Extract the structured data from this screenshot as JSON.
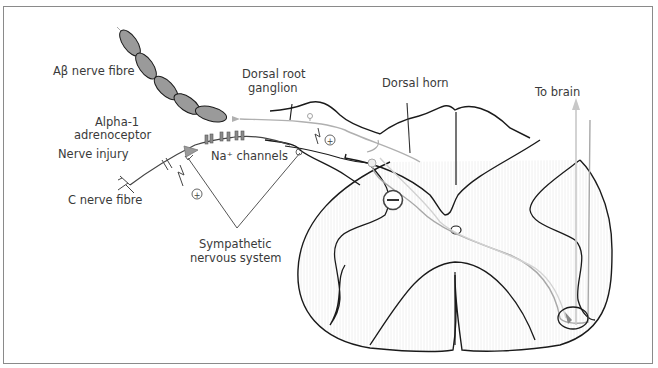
{
  "labels": {
    "ab_fibre": "Aβ nerve fibre",
    "drg_1": "Dorsal root",
    "drg_2": "ganglion",
    "dorsal_horn": "Dorsal horn",
    "to_brain": "To brain",
    "alpha_1": "Alpha-1",
    "alpha_2": "adrenoceptor",
    "nerve_injury": "Nerve injury",
    "na_channels": "Na⁺ channels",
    "c_fibre": "C nerve fibre",
    "sns_1": "Sympathetic",
    "sns_2": "nervous system"
  },
  "symbols": {
    "plus": "+",
    "minus": "−"
  },
  "colors": {
    "outline": "#1a1a1a",
    "grey_path": "#a8a8a8",
    "myelin_fill": "#9a9a9a",
    "text": "#3a3a3a",
    "frame": "#8a8a8a"
  }
}
